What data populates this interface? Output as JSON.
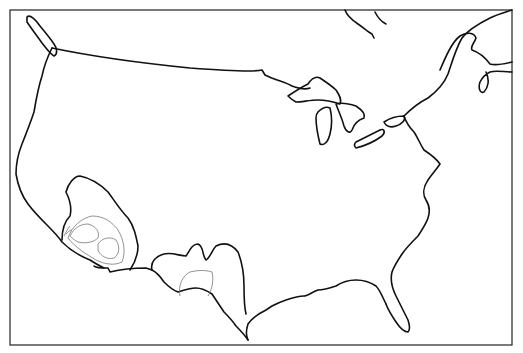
{
  "map": {
    "type": "outline-map",
    "region": "Contiguous United States with southern Canada",
    "frame": {
      "x": 10,
      "y": 10,
      "width": 502,
      "height": 335
    },
    "colors": {
      "coastline": "#111111",
      "contours": "#777777",
      "background": "#ffffff"
    },
    "features": [
      {
        "name": "coastline-and-borders",
        "style": "solid black line"
      },
      {
        "name": "great-lakes",
        "style": "solid black outlines"
      },
      {
        "name": "contour-region-southwest",
        "location": "southern California / Arizona",
        "style": "hachured contour lines"
      },
      {
        "name": "contour-region-south-central",
        "location": "New Mexico / Texas",
        "style": "hachured contour lines"
      }
    ],
    "labels": []
  }
}
